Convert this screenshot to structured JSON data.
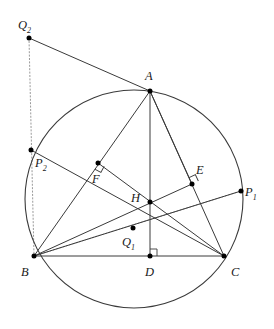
{
  "figure": {
    "background_color": "#ffffff",
    "stroke_color": "#3a3a3a",
    "point_color": "#000000",
    "dotted_color": "#9a9a9a"
  },
  "circle": {
    "name": "circumcircle",
    "cx": 134,
    "cy": 199,
    "r": 109
  },
  "points": [
    {
      "id": "A",
      "label": "A",
      "x": 150,
      "y": 91,
      "label_x": 145,
      "label_y": 70,
      "sub": ""
    },
    {
      "id": "B",
      "label": "B",
      "x": 34,
      "y": 256,
      "label_x": 21,
      "label_y": 266,
      "sub": ""
    },
    {
      "id": "C",
      "label": "C",
      "x": 224,
      "y": 256,
      "label_x": 231,
      "label_y": 266,
      "sub": ""
    },
    {
      "id": "D",
      "label": "D",
      "x": 150,
      "y": 256,
      "label_x": 145,
      "label_y": 266,
      "sub": ""
    },
    {
      "id": "E",
      "label": "E",
      "x": 192,
      "y": 184,
      "label_x": 196,
      "label_y": 164,
      "sub": ""
    },
    {
      "id": "F",
      "label": "F",
      "x": 98,
      "y": 163,
      "label_x": 92,
      "label_y": 173,
      "sub": ""
    },
    {
      "id": "H",
      "label": "H",
      "x": 150,
      "y": 202,
      "label_x": 131,
      "label_y": 192,
      "sub": ""
    },
    {
      "id": "P1",
      "label": "P",
      "x": 241,
      "y": 191,
      "label_x": 245,
      "label_y": 186,
      "sub": "1"
    },
    {
      "id": "P2",
      "label": "P",
      "x": 31,
      "y": 150,
      "label_x": 35,
      "label_y": 157,
      "sub": "2"
    },
    {
      "id": "Q1",
      "label": "Q",
      "x": 133,
      "y": 228,
      "label_x": 122,
      "label_y": 236,
      "sub": "1"
    },
    {
      "id": "Q2",
      "label": "Q",
      "x": 29,
      "y": 38,
      "label_x": 18,
      "label_y": 19,
      "sub": "2"
    }
  ],
  "solid_segments": [
    {
      "name": "side-BC",
      "from": "B",
      "to": "C"
    },
    {
      "name": "side-AB",
      "from": "A",
      "to": "B"
    },
    {
      "name": "side-AC",
      "from": "A",
      "to": "C"
    },
    {
      "name": "altitude-AD",
      "from": "A",
      "to": "D"
    },
    {
      "name": "altitude-BE-extended",
      "from": "B",
      "to": "P1"
    },
    {
      "name": "altitude-CF-extended",
      "from": "C",
      "to": "P2"
    },
    {
      "name": "cevian-AF-Q2",
      "from": "A",
      "to": "Q2"
    },
    {
      "name": "chord-FC",
      "from": "F",
      "to": "C"
    },
    {
      "name": "chord-EB",
      "from": "E",
      "to": "B"
    },
    {
      "name": "chord-AE",
      "from": "A",
      "to": "E"
    }
  ],
  "dotted_segments": [
    {
      "name": "dotted-Q2-B",
      "from": "Q2",
      "to": "B"
    },
    {
      "name": "dotted-B-P1",
      "from": "B",
      "to": "P1"
    }
  ],
  "right_angle_marks": [
    {
      "name": "right-angle-at-D",
      "x": 150,
      "y": 256,
      "rot": 0
    },
    {
      "name": "right-angle-at-E",
      "x": 192,
      "y": 184,
      "rot": -25
    },
    {
      "name": "right-angle-at-F",
      "x": 98,
      "y": 163,
      "rot": 118
    }
  ]
}
